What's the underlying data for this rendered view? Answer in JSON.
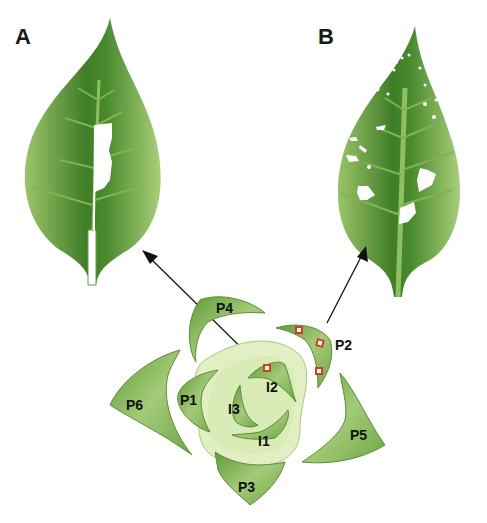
{
  "panels": {
    "a": {
      "label": "A"
    },
    "b": {
      "label": "B"
    }
  },
  "organs": {
    "p1": "P1",
    "p2": "P2",
    "p3": "P3",
    "p4": "P4",
    "p5": "P5",
    "p6": "P6",
    "i1": "I1",
    "i2": "I2",
    "i3": "I3"
  },
  "colors": {
    "leaf_dark": "#4f8a2e",
    "leaf_light": "#a8cc78",
    "apex_fill": "#e2efc4",
    "marker": "#d0401e",
    "arrow": "#111111"
  }
}
